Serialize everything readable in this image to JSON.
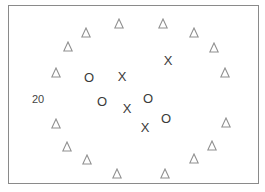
{
  "figure": {
    "frame": {
      "left": 8,
      "top": 5,
      "right": 259,
      "bottom": 184
    },
    "label": {
      "text": "20",
      "x": 38,
      "y": 99
    },
    "colors": {
      "triangle": "#8f8f8f",
      "glyph": "#3a3a3a",
      "border": "#8a8a8a"
    },
    "triangles": [
      {
        "x": 119,
        "y": 23
      },
      {
        "x": 163,
        "y": 23
      },
      {
        "x": 86,
        "y": 32
      },
      {
        "x": 194,
        "y": 32
      },
      {
        "x": 68,
        "y": 46
      },
      {
        "x": 214,
        "y": 47
      },
      {
        "x": 56,
        "y": 72
      },
      {
        "x": 225,
        "y": 72
      },
      {
        "x": 56,
        "y": 123
      },
      {
        "x": 226,
        "y": 122
      },
      {
        "x": 67,
        "y": 146
      },
      {
        "x": 212,
        "y": 145
      },
      {
        "x": 87,
        "y": 159
      },
      {
        "x": 194,
        "y": 158
      },
      {
        "x": 117,
        "y": 173
      },
      {
        "x": 165,
        "y": 173
      }
    ],
    "circles": [
      {
        "symbol": "O",
        "x": 89,
        "y": 77
      },
      {
        "symbol": "O",
        "x": 102,
        "y": 101
      },
      {
        "symbol": "O",
        "x": 148,
        "y": 98
      },
      {
        "symbol": "O",
        "x": 166,
        "y": 118
      }
    ],
    "crosses": [
      {
        "symbol": "X",
        "x": 122,
        "y": 76
      },
      {
        "symbol": "X",
        "x": 168,
        "y": 60
      },
      {
        "symbol": "X",
        "x": 127,
        "y": 108
      },
      {
        "symbol": "X",
        "x": 145,
        "y": 127
      }
    ]
  }
}
